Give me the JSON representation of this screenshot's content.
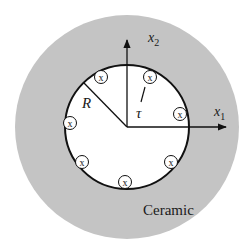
{
  "diagram": {
    "colors": {
      "background": "#ffffff",
      "ceramic": "#c4c4c4",
      "hole": "#ffffff",
      "stroke": "#111111"
    },
    "ceramic_label": "Ceramic",
    "radius_label": "R",
    "tau_label": "τ",
    "axes": {
      "x1": {
        "base": "x",
        "sub": "1"
      },
      "x2": {
        "base": "x",
        "sub": "2"
      }
    },
    "marker_glyph": "x",
    "markers": [
      {
        "cx": 101,
        "cy": 77
      },
      {
        "cx": 150,
        "cy": 77
      },
      {
        "cx": 180,
        "cy": 114
      },
      {
        "cx": 70,
        "cy": 123
      },
      {
        "cx": 82,
        "cy": 162
      },
      {
        "cx": 171,
        "cy": 162
      },
      {
        "cx": 125,
        "cy": 182
      }
    ]
  }
}
